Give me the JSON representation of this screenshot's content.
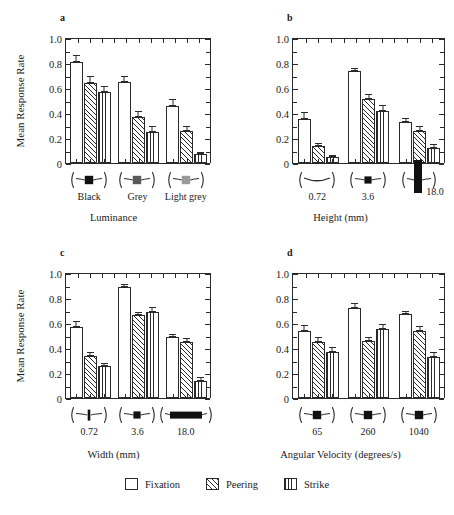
{
  "figure": {
    "legend": {
      "items": [
        {
          "label": "Fixation",
          "pattern": "open"
        },
        {
          "label": "Peering",
          "pattern": "diagonal-hatch"
        },
        {
          "label": "Strike",
          "pattern": "vertical-lines"
        }
      ]
    }
  },
  "chart_data": [
    {
      "type": "bar",
      "panel": "a",
      "title": "",
      "xlabel": "Luminance",
      "ylabel": "Mean Response Rate",
      "ylim": [
        0,
        1.0
      ],
      "yticks": [
        0,
        0.2,
        0.4,
        0.6,
        0.8,
        1.0
      ],
      "yticklabels": [
        "0",
        "0.2",
        "0.4",
        "0.6",
        "0.8",
        "1.0"
      ],
      "grid": false,
      "categories": [
        "Black",
        "Grey",
        "Light grey"
      ],
      "category_icons": [
        "prey-square-black",
        "prey-square-grey",
        "prey-square-light-grey"
      ],
      "series": [
        {
          "name": "Fixation",
          "values": [
            0.81,
            0.65,
            0.46
          ],
          "errors": [
            0.055,
            0.045,
            0.05
          ]
        },
        {
          "name": "Peering",
          "values": [
            0.64,
            0.37,
            0.26
          ],
          "errors": [
            0.055,
            0.045,
            0.04
          ]
        },
        {
          "name": "Strike",
          "values": [
            0.57,
            0.25,
            0.07
          ],
          "errors": [
            0.05,
            0.05,
            0.02
          ]
        }
      ]
    },
    {
      "type": "bar",
      "panel": "b",
      "title": "",
      "xlabel": "Height (mm)",
      "ylabel": "",
      "ylim": [
        0,
        1.0
      ],
      "yticks": [
        0,
        0.2,
        0.4,
        0.6,
        0.8,
        1.0
      ],
      "yticklabels": [
        "0",
        "0.2",
        "0.4",
        "0.6",
        "0.8",
        "1.0"
      ],
      "grid": false,
      "categories": [
        "0.72",
        "3.6",
        "18.0"
      ],
      "category_icons": [
        "prey-thin-line",
        "prey-square-small",
        "prey-tall-bar"
      ],
      "series": [
        {
          "name": "Fixation",
          "values": [
            0.35,
            0.74,
            0.33
          ],
          "errors": [
            0.06,
            0.02,
            0.03
          ]
        },
        {
          "name": "Peering",
          "values": [
            0.135,
            0.515,
            0.26
          ],
          "errors": [
            0.025,
            0.035,
            0.035
          ]
        },
        {
          "name": "Strike",
          "values": [
            0.05,
            0.415,
            0.12
          ],
          "errors": [
            0.015,
            0.05,
            0.03
          ]
        }
      ]
    },
    {
      "type": "bar",
      "panel": "c",
      "title": "",
      "xlabel": "Width (mm)",
      "ylabel": "Mean Response Rate",
      "ylim": [
        0,
        1.0
      ],
      "yticks": [
        0,
        0.2,
        0.4,
        0.6,
        0.8,
        1.0
      ],
      "yticklabels": [
        "0",
        "0.2",
        "0.4",
        "0.6",
        "0.8",
        "1.0"
      ],
      "grid": false,
      "categories": [
        "0.72",
        "3.6",
        "18.0"
      ],
      "category_icons": [
        "prey-narrow-bar",
        "prey-square-small",
        "prey-wide-bar"
      ],
      "series": [
        {
          "name": "Fixation",
          "values": [
            0.57,
            0.885,
            0.49
          ],
          "errors": [
            0.045,
            0.03,
            0.025
          ]
        },
        {
          "name": "Peering",
          "values": [
            0.335,
            0.665,
            0.445
          ],
          "errors": [
            0.03,
            0.025,
            0.035
          ]
        },
        {
          "name": "Strike",
          "values": [
            0.255,
            0.685,
            0.135
          ],
          "errors": [
            0.025,
            0.04,
            0.035
          ]
        }
      ]
    },
    {
      "type": "bar",
      "panel": "d",
      "title": "",
      "xlabel": "Angular Velocity (degrees/s)",
      "ylabel": "",
      "ylim": [
        0,
        1.0
      ],
      "yticks": [
        0,
        0.2,
        0.4,
        0.6,
        0.8,
        1.0
      ],
      "yticklabels": [
        "0",
        "0.2",
        "0.4",
        "0.6",
        "0.8",
        "1.0"
      ],
      "grid": false,
      "categories": [
        "65",
        "260",
        "1040"
      ],
      "category_icons": [
        "prey-square-black",
        "prey-square-black",
        "prey-square-black"
      ],
      "series": [
        {
          "name": "Fixation",
          "values": [
            0.54,
            0.72,
            0.67
          ],
          "errors": [
            0.045,
            0.04,
            0.03
          ]
        },
        {
          "name": "Peering",
          "values": [
            0.45,
            0.46,
            0.54
          ],
          "errors": [
            0.04,
            0.025,
            0.04
          ]
        },
        {
          "name": "Strike",
          "values": [
            0.365,
            0.555,
            0.33
          ],
          "errors": [
            0.04,
            0.035,
            0.035
          ]
        }
      ]
    }
  ],
  "panels": {
    "a": {
      "letter": "a"
    },
    "b": {
      "letter": "b"
    },
    "c": {
      "letter": "c"
    },
    "d": {
      "letter": "d"
    }
  }
}
